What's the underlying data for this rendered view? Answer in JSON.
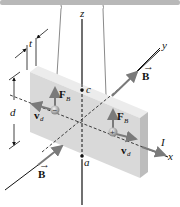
{
  "diagram": {
    "labels": {
      "z_axis": "z",
      "y_axis": "y",
      "x_axis": "x",
      "thickness": "t",
      "height": "d",
      "point_c": "c",
      "point_a": "a",
      "current": "I",
      "field_top": "B",
      "field_bottom": "B",
      "force_left": "F",
      "force_left_sub": "B",
      "force_right": "F",
      "force_right_sub": "B",
      "drift_left": "v",
      "drift_left_sub": "d",
      "drift_right": "v",
      "drift_right_sub": "d",
      "charge_left": "−",
      "charge_right": "+"
    },
    "colors": {
      "support_bar": "#b8b8b8",
      "slab_front": "#d9d9d9",
      "slab_top": "#ececec",
      "slab_side": "#bdbdbd",
      "arrow": "#7a7a7a",
      "axis": "#111111"
    }
  }
}
